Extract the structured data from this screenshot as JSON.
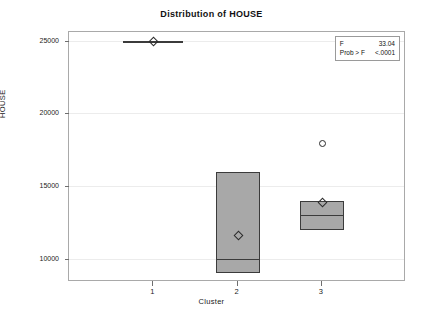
{
  "chart_data": {
    "type": "box",
    "title": "Distribution of HOUSE",
    "xlabel": "Cluster",
    "ylabel": "HOUSE",
    "categories": [
      "1",
      "2",
      "3"
    ],
    "ytick_labels": [
      "25000",
      "20000",
      "15000",
      "10000"
    ],
    "ytick_values": [
      25000,
      20000,
      15000,
      10000
    ],
    "ylim": [
      8400,
      25600
    ],
    "grid": true,
    "legend": "none",
    "boxes": [
      {
        "category": "1",
        "q1": 25000,
        "median": 25000,
        "q3": 25000,
        "whisker_low": 25000,
        "whisker_high": 25000,
        "mean": 25000,
        "degenerate": true,
        "outliers": []
      },
      {
        "category": "2",
        "q1": 9000,
        "median": 10000,
        "q3": 16000,
        "whisker_low": 9000,
        "whisker_high": 16000,
        "mean": 11650,
        "degenerate": false,
        "outliers": []
      },
      {
        "category": "3",
        "q1": 12000,
        "median": 13000,
        "q3": 14000,
        "whisker_low": 12000,
        "whisker_high": 14000,
        "mean": 13900,
        "degenerate": false,
        "outliers": [
          18000
        ]
      }
    ]
  },
  "stats": {
    "f_label": "F",
    "f_value": "33.04",
    "prob_label": "Prob > F",
    "prob_value": "<.0001"
  }
}
